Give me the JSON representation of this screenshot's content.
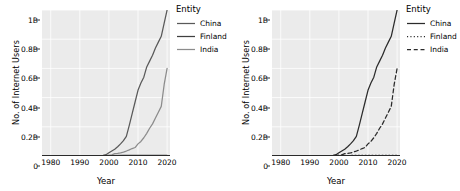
{
  "figure": {
    "panels": [
      {
        "id": "left",
        "encoding": "color",
        "legend_title": "Entity",
        "legend_items": [
          {
            "label": "China",
            "style": "solid",
            "color": "#595959"
          },
          {
            "label": "Finland",
            "style": "solid",
            "color": "#3f3f3f"
          },
          {
            "label": "India",
            "style": "solid",
            "color": "#8c8c8c"
          }
        ]
      },
      {
        "id": "right",
        "encoding": "linetype",
        "legend_title": "Entity",
        "legend_items": [
          {
            "label": "China",
            "style": "solid",
            "color": "#2b2b2b"
          },
          {
            "label": "Finland",
            "style": "dotted",
            "color": "#2b2b2b"
          },
          {
            "label": "India",
            "style": "dashed",
            "color": "#2b2b2b"
          }
        ]
      }
    ]
  },
  "chart_data": {
    "type": "line",
    "title": "",
    "xlabel": "Year",
    "ylabel": "No. of Internet Users",
    "xlim": [
      1977,
      2021
    ],
    "ylim": [
      0,
      1.0
    ],
    "grid": true,
    "legend_position": "right",
    "xticks": [
      1980,
      1990,
      2000,
      2010,
      2020
    ],
    "xtick_labels": [
      "1980",
      "1990",
      "2000",
      "2010",
      "2020"
    ],
    "yticks": [
      0,
      0.2,
      0.4,
      0.6,
      0.8,
      1.0
    ],
    "ytick_labels": [
      "0",
      "0.2B",
      "0.4B",
      "0.6B",
      "0.8B",
      "1B"
    ],
    "unit": "billions of internet users",
    "series": [
      {
        "name": "China",
        "linestyle_left": "solid",
        "linestyle_right": "solid",
        "x": [
          1980,
          1985,
          1990,
          1994,
          1996,
          1998,
          1999,
          2000,
          2001,
          2002,
          2003,
          2004,
          2005,
          2006,
          2007,
          2008,
          2009,
          2010,
          2011,
          2012,
          2013,
          2014,
          2015,
          2016,
          2017,
          2018,
          2019,
          2020
        ],
        "y": [
          0,
          0,
          0,
          0,
          0.001,
          0.004,
          0.009,
          0.022,
          0.034,
          0.046,
          0.063,
          0.083,
          0.105,
          0.135,
          0.21,
          0.29,
          0.37,
          0.45,
          0.5,
          0.54,
          0.61,
          0.65,
          0.69,
          0.74,
          0.78,
          0.82,
          0.91,
          1.0
        ]
      },
      {
        "name": "Finland",
        "linestyle_left": "solid",
        "linestyle_right": "dotted",
        "x": [
          1980,
          1990,
          1995,
          2000,
          2005,
          2010,
          2015,
          2020
        ],
        "y": [
          0,
          0,
          0.001,
          0.002,
          0.004,
          0.005,
          0.005,
          0.005
        ]
      },
      {
        "name": "India",
        "linestyle_left": "solid",
        "linestyle_right": "dashed",
        "x": [
          1980,
          1990,
          1995,
          1998,
          1999,
          2000,
          2001,
          2002,
          2003,
          2004,
          2005,
          2006,
          2007,
          2008,
          2009,
          2010,
          2011,
          2012,
          2013,
          2014,
          2015,
          2016,
          2017,
          2018,
          2019,
          2020
        ],
        "y": [
          0,
          0,
          0.0003,
          0.0014,
          0.003,
          0.0055,
          0.008,
          0.016,
          0.018,
          0.021,
          0.027,
          0.034,
          0.042,
          0.051,
          0.058,
          0.083,
          0.1,
          0.125,
          0.155,
          0.19,
          0.22,
          0.26,
          0.3,
          0.34,
          0.49,
          0.6
        ]
      }
    ]
  }
}
